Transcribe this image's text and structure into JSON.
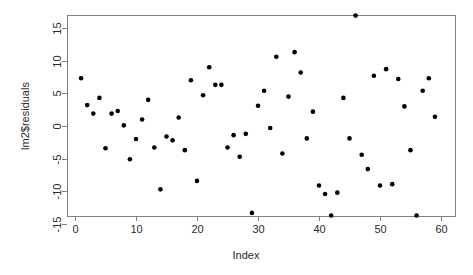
{
  "chart_data": {
    "type": "scatter",
    "title": "",
    "xlabel": "Index",
    "ylabel": "lm2$residuals",
    "xlim": [
      0,
      60
    ],
    "ylim": [
      -15,
      17.5
    ],
    "grid": false,
    "legend": null,
    "xticks": [
      0,
      10,
      20,
      30,
      40,
      50,
      60
    ],
    "xtick_labels": [
      "0",
      "10",
      "20",
      "30",
      "40",
      "50",
      "60"
    ],
    "yticks": [
      15,
      10,
      5,
      0,
      -5,
      -10,
      -15
    ],
    "ytick_labels": [
      "15",
      "10",
      "5",
      "0",
      "-5",
      "-10",
      "-15"
    ],
    "point_marker": "filled-circle",
    "point_color": "#000000",
    "point_count": 59,
    "x": [
      1,
      2,
      3,
      4,
      5,
      6,
      7,
      8,
      9,
      10,
      11,
      12,
      13,
      14,
      15,
      16,
      17,
      18,
      19,
      20,
      21,
      22,
      23,
      24,
      25,
      26,
      27,
      28,
      29,
      30,
      31,
      32,
      33,
      34,
      35,
      36,
      37,
      38,
      39,
      40,
      41,
      42,
      43,
      44,
      45,
      46,
      47,
      48,
      49,
      50,
      51,
      52,
      53,
      54,
      55,
      56,
      57,
      58,
      59
    ],
    "y": [
      7.3,
      3.2,
      1.9,
      4.3,
      -3.4,
      1.9,
      2.3,
      0.1,
      -5.1,
      -2.0,
      1.0,
      4.0,
      -3.3,
      -9.7,
      -1.6,
      -2.2,
      1.3,
      -3.7,
      7.0,
      -8.4,
      4.7,
      9.0,
      6.3,
      6.3,
      -3.3,
      -1.4,
      -4.7,
      -1.2,
      -13.3,
      3.1,
      5.4,
      -0.3,
      10.6,
      -4.2,
      4.5,
      11.3,
      8.2,
      -1.9,
      2.2,
      -9.1,
      -10.4,
      -13.7,
      -10.2,
      4.3,
      -1.9,
      16.9,
      -4.4,
      -6.6,
      7.7,
      -9.1,
      8.7,
      -8.9,
      7.2,
      3.0,
      -3.7,
      -13.7,
      5.4,
      7.3,
      1.4
    ]
  },
  "axes": {
    "xlabel": "Index",
    "ylabel": "lm2$residuals"
  }
}
